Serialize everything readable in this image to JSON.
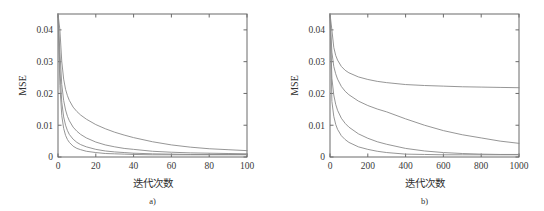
{
  "figure": {
    "background": "#ffffff",
    "axis_color": "#6b6b6b",
    "curve_color": "#8a8a8a",
    "text_color": "#2f2f2f"
  },
  "chart_data": [
    {
      "type": "line",
      "panel_id": "a",
      "caption": "a)",
      "title": "",
      "xlabel": "迭代次数",
      "ylabel": "MSE",
      "xlim": [
        0,
        100
      ],
      "ylim": [
        0,
        0.045
      ],
      "grid": false,
      "legend": "none",
      "xticks": [
        0,
        20,
        40,
        60,
        80,
        100
      ],
      "xticklabels": [
        "0",
        "20",
        "40",
        "60",
        "80",
        "100"
      ],
      "yticks": [
        0,
        0.01,
        0.02,
        0.03,
        0.04
      ],
      "yticklabels": [
        "0",
        "0.01",
        "0.02",
        "0.03",
        "0.04"
      ],
      "x": [
        0,
        1,
        2,
        3,
        4,
        5,
        6,
        8,
        10,
        12,
        15,
        20,
        25,
        30,
        35,
        40,
        50,
        60,
        70,
        80,
        90,
        100
      ],
      "series": [
        {
          "name": "curve-1",
          "values": [
            0.045,
            0.04,
            0.03,
            0.0245,
            0.0213,
            0.0193,
            0.0178,
            0.0157,
            0.0143,
            0.0132,
            0.0119,
            0.0102,
            0.0089,
            0.0078,
            0.0069,
            0.0061,
            0.0048,
            0.0038,
            0.0031,
            0.0026,
            0.0023,
            0.002
          ]
        },
        {
          "name": "curve-2",
          "values": [
            0.045,
            0.033,
            0.0228,
            0.0178,
            0.0148,
            0.0128,
            0.0114,
            0.0094,
            0.0081,
            0.0071,
            0.006,
            0.0047,
            0.0038,
            0.0032,
            0.0027,
            0.0024,
            0.0018,
            0.0015,
            0.0013,
            0.0012,
            0.0011,
            0.001
          ]
        },
        {
          "name": "curve-3",
          "values": [
            0.045,
            0.0275,
            0.0172,
            0.0126,
            0.01,
            0.0083,
            0.0071,
            0.0056,
            0.0046,
            0.0039,
            0.0032,
            0.0024,
            0.0019,
            0.0016,
            0.0014,
            0.0012,
            0.001,
            0.0009,
            0.0008,
            0.0008,
            0.0008,
            0.0008
          ]
        },
        {
          "name": "curve-4",
          "values": [
            0.045,
            0.0225,
            0.013,
            0.009,
            0.0068,
            0.0055,
            0.0046,
            0.0034,
            0.0027,
            0.0023,
            0.0018,
            0.0014,
            0.0011,
            0.001,
            0.0009,
            0.0008,
            0.0007,
            0.0007,
            0.0007,
            0.0007,
            0.0007,
            0.0007
          ]
        }
      ]
    },
    {
      "type": "line",
      "panel_id": "b",
      "caption": "b)",
      "title": "",
      "xlabel": "迭代次数",
      "ylabel": "MSE",
      "xlim": [
        0,
        1000
      ],
      "ylim": [
        0,
        0.045
      ],
      "grid": false,
      "legend": "none",
      "xticks": [
        0,
        200,
        400,
        600,
        800,
        1000
      ],
      "xticklabels": [
        "0",
        "200",
        "400",
        "600",
        "800",
        "1000"
      ],
      "yticks": [
        0,
        0.01,
        0.02,
        0.03,
        0.04
      ],
      "yticklabels": [
        "0",
        "0.01",
        "0.02",
        "0.03",
        "0.04"
      ],
      "x": [
        0,
        10,
        20,
        30,
        40,
        60,
        80,
        100,
        150,
        200,
        250,
        300,
        400,
        500,
        600,
        700,
        800,
        900,
        1000
      ],
      "series": [
        {
          "name": "curve-1",
          "values": [
            0.045,
            0.04,
            0.0345,
            0.032,
            0.0305,
            0.0285,
            0.0273,
            0.0265,
            0.0252,
            0.0244,
            0.0238,
            0.0234,
            0.0228,
            0.0225,
            0.0223,
            0.0221,
            0.022,
            0.0219,
            0.0218
          ]
        },
        {
          "name": "curve-2",
          "values": [
            0.045,
            0.033,
            0.0285,
            0.0262,
            0.0245,
            0.0222,
            0.0207,
            0.0196,
            0.0176,
            0.0162,
            0.0151,
            0.0142,
            0.012,
            0.01,
            0.0083,
            0.007,
            0.006,
            0.005,
            0.0043
          ]
        },
        {
          "name": "curve-3",
          "values": [
            0.045,
            0.0248,
            0.0195,
            0.0166,
            0.0147,
            0.0122,
            0.0106,
            0.0094,
            0.0073,
            0.0059,
            0.0048,
            0.004,
            0.0027,
            0.0019,
            0.0014,
            0.0011,
            0.0009,
            0.0008,
            0.0008
          ]
        },
        {
          "name": "curve-4",
          "values": [
            0.045,
            0.0175,
            0.0128,
            0.0103,
            0.0087,
            0.0067,
            0.0055,
            0.0046,
            0.0032,
            0.0024,
            0.0018,
            0.0014,
            0.0009,
            0.0008,
            0.0007,
            0.0007,
            0.0007,
            0.0007,
            0.0007
          ]
        }
      ]
    }
  ]
}
